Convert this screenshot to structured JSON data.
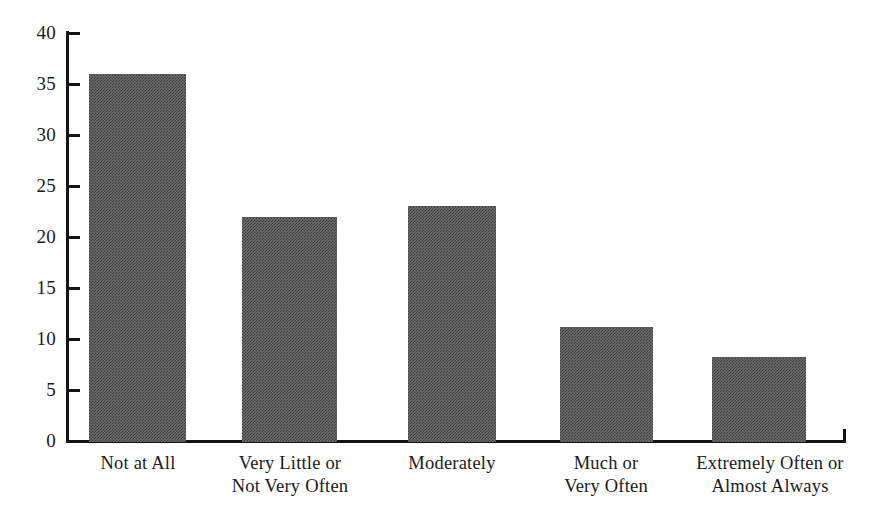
{
  "chart_data": {
    "type": "bar",
    "title": "",
    "subtitle": "",
    "xlabel": "",
    "ylabel": "",
    "categories": [
      "Not at All",
      "Very Little or\nNot Very Often",
      "Moderately",
      "Much or\nVery Often",
      "Extremely Often or\nAlmost Always"
    ],
    "values": [
      36,
      22,
      23,
      11.2,
      8.2
    ],
    "ylim": [
      0,
      40
    ],
    "ytick_labels": [
      "0",
      "5",
      "10",
      "15",
      "20",
      "25",
      "30",
      "35",
      "40"
    ],
    "ytick_values": [
      0,
      5,
      10,
      15,
      20,
      25,
      30,
      35,
      40
    ],
    "grid": false,
    "legend": null,
    "legend_position": "none",
    "bar_color": "#6e6e6e",
    "axis_color": "#141414",
    "background_color": "#ffffff"
  },
  "axis": {
    "y_ticks": [
      {
        "label": "40",
        "value": 40
      },
      {
        "label": "35",
        "value": 35
      },
      {
        "label": "30",
        "value": 30
      },
      {
        "label": "25",
        "value": 25
      },
      {
        "label": "20",
        "value": 20
      },
      {
        "label": "15",
        "value": 15
      },
      {
        "label": "10",
        "value": 10
      },
      {
        "label": "5",
        "value": 5
      },
      {
        "label": "0",
        "value": 0
      }
    ]
  },
  "bars": [
    {
      "label": "Not at All",
      "value": 36
    },
    {
      "label": "Very Little or\nNot Very Often",
      "value": 22
    },
    {
      "label": "Moderately",
      "value": 23
    },
    {
      "label": "Much or\nVery Often",
      "value": 11.2
    },
    {
      "label": "Extremely Often or\nAlmost Always",
      "value": 8.2
    }
  ]
}
